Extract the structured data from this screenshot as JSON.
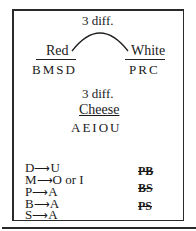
{
  "diagram": {
    "top_connector_label": "3 diff.",
    "groups": [
      {
        "label": "Red",
        "letters": "BMSD"
      },
      {
        "label": "White",
        "letters": "PRC"
      }
    ],
    "middle_label": "3 diff.",
    "cheese": {
      "label": "Cheese",
      "letters": "AEIOU"
    },
    "rules": [
      {
        "from": "D",
        "arrow": "⟶",
        "to": "U"
      },
      {
        "from": "M",
        "arrow": "⟶",
        "to": "O or I"
      },
      {
        "from": "P",
        "arrow": "⟶",
        "to": "A"
      },
      {
        "from": "B",
        "arrow": "⟶",
        "to": "A"
      },
      {
        "from": "S",
        "arrow": "⟶",
        "to": "A"
      }
    ],
    "crossed_out": [
      "PB",
      "BS",
      "PS"
    ]
  }
}
